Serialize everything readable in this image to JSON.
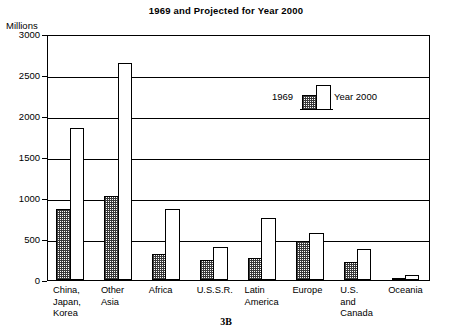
{
  "chart_data": {
    "type": "bar",
    "title": "1969 and Projected for Year 2000",
    "figure_label": "3B",
    "ylabel": "Millions",
    "xlabel": "",
    "ylim": [
      0,
      3000
    ],
    "yticks": [
      0,
      500,
      1000,
      1500,
      2000,
      2500,
      3000
    ],
    "ytick_labels": [
      "0",
      "500",
      "1000",
      "1500",
      "2000",
      "2500",
      "3000"
    ],
    "grid": true,
    "legend_position": "inside-upper-center",
    "categories": [
      "China,\nJapan,\nKorea",
      "Other\nAsia",
      "Africa",
      "U.S.S.R.",
      "Latin\nAmerica",
      "Europe",
      "U.S.\nand\nCanada",
      "Oceania"
    ],
    "series": [
      {
        "name": "1969",
        "fill": "hatched",
        "values": [
          870,
          1020,
          320,
          240,
          270,
          470,
          225,
          20
        ]
      },
      {
        "name": "Year 2000",
        "fill": "white",
        "values": [
          1850,
          2650,
          860,
          400,
          760,
          570,
          375,
          60
        ]
      }
    ]
  },
  "colors": {
    "axis": "#000000",
    "grid": "#000000",
    "background": "#ffffff",
    "hatch": "#3a3a3a"
  }
}
